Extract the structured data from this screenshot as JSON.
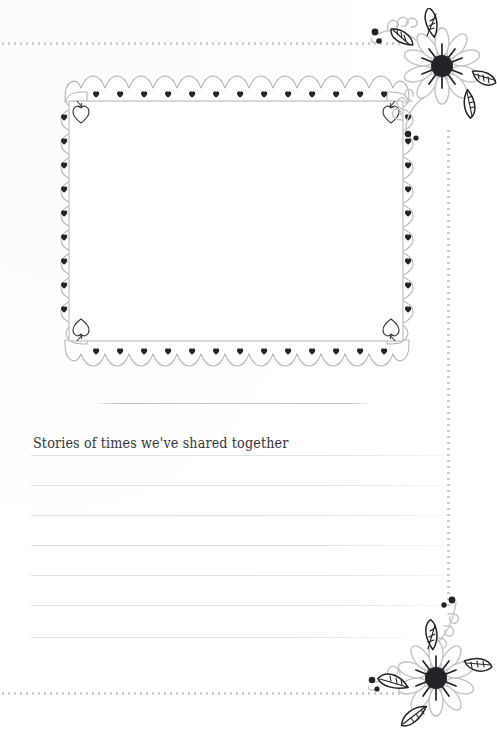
{
  "page": {
    "kind": "scrapbook-journal-page",
    "background_color": "#ffffff",
    "width": 497,
    "height": 732
  },
  "colors": {
    "ink_dark": "#2a2a2e",
    "pencil_gray": "#b9b9c0",
    "rule_gray": "#dedee3",
    "dot_gray": "#c9c9cf",
    "text_color": "#35353b",
    "leaf_dark": "#26262a",
    "petal_outline": "#c3c3c9"
  },
  "border": {
    "style": "dotted",
    "segments": [
      {
        "name": "dot-top",
        "orientation": "horizontal"
      },
      {
        "name": "dot-bottom",
        "orientation": "horizontal"
      },
      {
        "name": "dot-right-top",
        "orientation": "vertical"
      },
      {
        "name": "dot-right-bottom",
        "orientation": "vertical"
      }
    ]
  },
  "photo_frame": {
    "label": "photo-placeholder",
    "style": "scalloped-cloud-border-with-hearts",
    "scallops_top": 11,
    "scallops_bottom": 11,
    "scallops_side": 8,
    "corner_motif": "heart-with-arrow",
    "inner_fill": "#ffffff"
  },
  "caption": {
    "rule_above": true,
    "text": "Stories of times we've shared together"
  },
  "writing_lines": {
    "count": 7,
    "start_y": [
      455,
      485,
      515,
      545,
      575,
      605,
      637
    ],
    "left": 31,
    "widths": [
      416,
      416,
      416,
      416,
      416,
      410,
      372
    ]
  },
  "decorations": [
    {
      "name": "floral-corner-top-right",
      "type": "daisy-flower-with-leaves-and-sprigs",
      "petals": 10,
      "center_color": "#2a2a2e"
    },
    {
      "name": "floral-corner-bottom-right",
      "type": "daisy-flower-with-leaves-and-sprigs",
      "petals": 10,
      "center_color": "#2a2a2e"
    }
  ]
}
